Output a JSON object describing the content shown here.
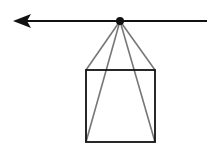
{
  "diagram": {
    "colors": {
      "line": "#111111",
      "connector": "#777777",
      "background": "#ffffff"
    },
    "horizontal_line": {
      "x1": 14,
      "y1": 21,
      "x2": 207,
      "y2": 21,
      "arrow": "left"
    },
    "apex_point": {
      "x": 120,
      "y": 21,
      "r": 4
    },
    "square": {
      "x": 86,
      "y": 70,
      "width": 69,
      "height": 72
    },
    "connectors": [
      {
        "to": "top-left"
      },
      {
        "to": "bottom-left"
      },
      {
        "to": "bottom-right"
      },
      {
        "to": "top-right"
      }
    ]
  }
}
